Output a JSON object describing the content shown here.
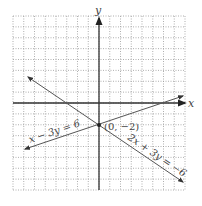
{
  "chart_data": {
    "type": "line",
    "title": "",
    "xlabel": "x",
    "ylabel": "y",
    "xlim": [
      -8,
      8
    ],
    "ylim": [
      -8,
      8
    ],
    "grid": true,
    "grid_style": "dotted",
    "tick_labels": false,
    "series": [
      {
        "name": "x − 3y = 6",
        "equation": "x - 3y = 6",
        "slope": 0.3333,
        "intercept": -2,
        "x": [
          -7,
          8
        ],
        "y": [
          -4.333,
          0.667
        ],
        "arrows": "both"
      },
      {
        "name": "2x + 3y = −6",
        "equation": "2x + 3y = -6",
        "slope": -0.6667,
        "intercept": -2,
        "x": [
          -6.5,
          8
        ],
        "y": [
          2.333,
          -7.333
        ],
        "arrows": "both"
      }
    ],
    "points": [
      {
        "x": 0,
        "y": -2,
        "label": "(0, −2)"
      }
    ],
    "annotations": [
      {
        "text": "x − 3y = 6",
        "near_series": 0
      },
      {
        "text": "2x + 3y = −6",
        "near_series": 1
      },
      {
        "text": "(0, −2)",
        "near_point": 0
      }
    ]
  },
  "labels": {
    "x_axis": "x",
    "y_axis": "y",
    "line1": "x − 3y = 6",
    "line2": "2x + 3y = −6",
    "intersection": "(0, −2)"
  },
  "colors": {
    "axis": "#333333",
    "grid": "#9a9a9a",
    "line": "#555555",
    "text": "#444444"
  }
}
